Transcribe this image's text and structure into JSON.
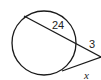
{
  "diagram": {
    "type": "circle-secant-tangent",
    "labels": {
      "secant_internal": "24",
      "secant_external": "3",
      "tangent": "x"
    },
    "colors": {
      "stroke": "#1a1a1a",
      "background": "#ffffff"
    }
  }
}
